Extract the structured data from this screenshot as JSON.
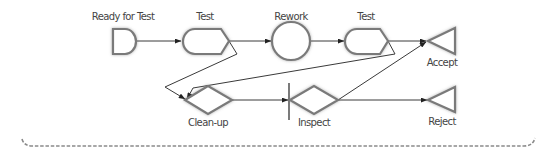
{
  "diagram": {
    "type": "process-flow",
    "colors": {
      "shape_stroke": "#7a7a7a",
      "edge": "#3a3a3a",
      "label": "#444444",
      "brace": "#8a8a8a",
      "background": "#ffffff"
    },
    "nodes": [
      {
        "id": "ready",
        "shape": "delay",
        "label": "Ready for Test"
      },
      {
        "id": "test1",
        "shape": "display",
        "label": "Test"
      },
      {
        "id": "rework",
        "shape": "circle",
        "label": "Rework"
      },
      {
        "id": "test2",
        "shape": "display",
        "label": "Test"
      },
      {
        "id": "accept",
        "shape": "triangle",
        "label": "Accept"
      },
      {
        "id": "cleanup",
        "shape": "diamond",
        "label": "Clean-up"
      },
      {
        "id": "inspect",
        "shape": "diamond-with-bar",
        "label": "Inspect"
      },
      {
        "id": "reject",
        "shape": "triangle",
        "label": "Reject"
      }
    ],
    "edges": [
      {
        "from": "ready",
        "to": "test1"
      },
      {
        "from": "test1",
        "to": "rework"
      },
      {
        "from": "rework",
        "to": "test2"
      },
      {
        "from": "test2",
        "to": "accept"
      },
      {
        "from": "test1",
        "to": "cleanup"
      },
      {
        "from": "test2",
        "to": "cleanup"
      },
      {
        "from": "cleanup",
        "to": "inspect"
      },
      {
        "from": "inspect",
        "to": "accept"
      },
      {
        "from": "inspect",
        "to": "reject"
      }
    ],
    "brace": {
      "style": "dashed",
      "position": "bottom"
    }
  }
}
